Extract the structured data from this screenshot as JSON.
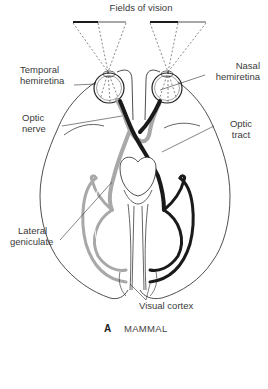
{
  "figure": {
    "title": "Fields of vision",
    "panel_letter": "A",
    "panel_caption": "MAMMAL",
    "colors": {
      "left_field": "#1a1a1a",
      "right_field": "#a8a8a8",
      "outline": "#222222",
      "background": "#ffffff"
    }
  },
  "labels": {
    "temporal_hemiretina": [
      "Temporal",
      "hemiretina"
    ],
    "nasal_hemiretina": [
      "Nasal",
      "hemiretina"
    ],
    "optic_nerve": [
      "Optic",
      "nerve"
    ],
    "optic_tract": [
      "Optic",
      "tract"
    ],
    "lateral_geniculate": [
      "Lateral",
      "geniculate"
    ],
    "visual_cortex": "Visual cortex"
  }
}
